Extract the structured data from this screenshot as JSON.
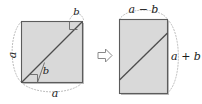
{
  "figure": {
    "colors": {
      "shape_fill": "#d9d9d9",
      "shape_stroke": "#595959",
      "diagonal_stroke": "#4d4d4d",
      "guide_dotted": "#a6a6a6",
      "arrow_stroke": "#808080",
      "label_color": "#1a1a1a",
      "shadow": "#b3b3b3",
      "background": "#ffffff"
    },
    "left_panel": {
      "name": "square-figure",
      "shape": "square",
      "labels": {
        "left_side": "a",
        "bottom_side": "a",
        "top_segment": "b",
        "inner_segment": "b"
      },
      "right_angle_markers": 2,
      "guide_arcs": [
        "left-arc",
        "bottom-arc",
        "top-right-arc"
      ],
      "diagonal": "bottom-left to top-right"
    },
    "operator": {
      "name": "transform-arrow",
      "glyph": "right-arrow",
      "meaning": "becomes"
    },
    "right_panel": {
      "name": "rectangle-figure",
      "shape": "rectangle",
      "labels": {
        "top_side": "a − b",
        "right_side": "a + b"
      },
      "guide_arcs": [
        "top-arc",
        "right-arc"
      ],
      "diagonal": "left edge to right edge"
    }
  }
}
